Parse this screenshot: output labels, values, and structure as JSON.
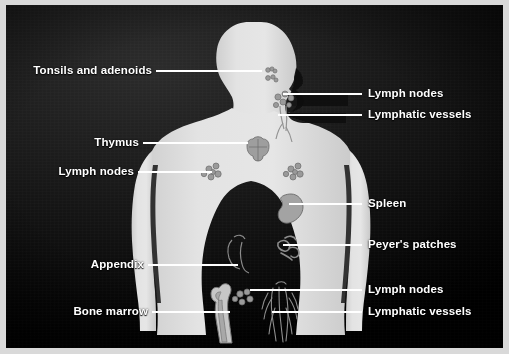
{
  "figure": {
    "frame_color": "#d9d9d9",
    "background_color": "#000000",
    "body_color": "#dcdcdc"
  },
  "labels": {
    "left": [
      {
        "id": "tonsils-and-adenoids",
        "text": "Tonsils and adenoids",
        "text_x": 10,
        "text_y": 64,
        "line_x1": 156,
        "line_x2": 262,
        "line_y": 71
      },
      {
        "id": "thymus",
        "text": "Thymus",
        "text_x": 93,
        "text_y": 136,
        "line_x1": 143,
        "line_x2": 248,
        "line_y": 143
      },
      {
        "id": "lymph-nodes-axillary",
        "text": "Lymph nodes",
        "text_x": 52,
        "text_y": 165,
        "line_x1": 138,
        "line_x2": 212,
        "line_y": 172
      },
      {
        "id": "appendix",
        "text": "Appendix",
        "text_x": 83,
        "text_y": 258,
        "line_x1": 148,
        "line_x2": 238,
        "line_y": 265
      },
      {
        "id": "bone-marrow",
        "text": "Bone marrow",
        "text_x": 62,
        "text_y": 305,
        "line_x1": 152,
        "line_x2": 230,
        "line_y": 312
      }
    ],
    "right": [
      {
        "id": "lymph-nodes-cervical",
        "text": "Lymph nodes",
        "text_x": 368,
        "text_y": 87,
        "line_x1": 283,
        "line_x2": 362,
        "line_y": 94
      },
      {
        "id": "lymphatic-vessels-upper",
        "text": "Lymphatic vessels",
        "text_x": 368,
        "text_y": 108,
        "line_x1": 278,
        "line_x2": 362,
        "line_y": 115
      },
      {
        "id": "spleen",
        "text": "Spleen",
        "text_x": 368,
        "text_y": 197,
        "line_x1": 289,
        "line_x2": 362,
        "line_y": 204
      },
      {
        "id": "peyers-patches",
        "text": "Peyer's patches",
        "text_x": 368,
        "text_y": 238,
        "line_x1": 283,
        "line_x2": 362,
        "line_y": 245
      },
      {
        "id": "lymph-nodes-inguinal",
        "text": "Lymph nodes",
        "text_x": 368,
        "text_y": 283,
        "line_x1": 250,
        "line_x2": 362,
        "line_y": 290
      },
      {
        "id": "lymphatic-vessels-lower",
        "text": "Lymphatic vessels",
        "text_x": 368,
        "text_y": 305,
        "line_x1": 272,
        "line_x2": 362,
        "line_y": 312
      }
    ]
  },
  "anatomy": {
    "parts": [
      "body-silhouette",
      "head-profile",
      "tonsils",
      "adenoids",
      "cervical-lymph-nodes",
      "cervical-lymphatic-vessels",
      "thymus",
      "left-axillary-lymph-nodes",
      "right-axillary-lymph-nodes",
      "spleen",
      "peyers-patches",
      "appendix",
      "femur-bone-marrow",
      "inguinal-lymph-nodes",
      "leg-lymphatic-vessels"
    ]
  }
}
